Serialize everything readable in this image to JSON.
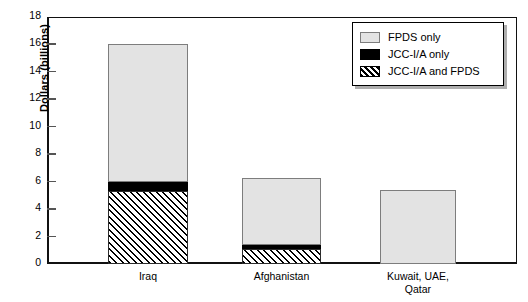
{
  "chart_data": {
    "type": "bar",
    "stacked": true,
    "title": "",
    "xlabel": "",
    "ylabel": "Dollars (billions)",
    "ylim": [
      0,
      18
    ],
    "yticks": [
      0,
      2,
      4,
      6,
      8,
      10,
      12,
      14,
      16,
      18
    ],
    "ytick_labels": [
      "0",
      "2",
      "4",
      "6",
      "8",
      "10",
      "12",
      "14",
      "16",
      "18"
    ],
    "grid": false,
    "legend_position": "top-right",
    "categories": [
      "Iraq",
      "Afghanistan",
      "Kuwait, UAE, Qatar"
    ],
    "category_lines": [
      [
        "Iraq"
      ],
      [
        "Afghanistan"
      ],
      [
        "Kuwait, UAE,",
        "Qatar"
      ]
    ],
    "series": [
      {
        "name": "JCC-I/A and FPDS",
        "style": "hatched",
        "color": "#000000",
        "values": [
          5.3,
          1.1,
          0
        ]
      },
      {
        "name": "JCC-I/A only",
        "style": "solid-black",
        "color": "#000000",
        "values": [
          0.7,
          0.3,
          0
        ]
      },
      {
        "name": "FPDS only",
        "style": "light-gray",
        "color": "#e3e3e3",
        "values": [
          10.0,
          4.9,
          5.4
        ]
      }
    ],
    "totals": [
      16.0,
      6.3,
      5.4
    ]
  },
  "legend": {
    "items": [
      {
        "label": "FPDS only",
        "swatch": "light-gray-swatch"
      },
      {
        "label": "JCC-I/A only",
        "swatch": "black-swatch"
      },
      {
        "label": "JCC-I/A and FPDS",
        "swatch": "hatched-swatch"
      }
    ]
  }
}
